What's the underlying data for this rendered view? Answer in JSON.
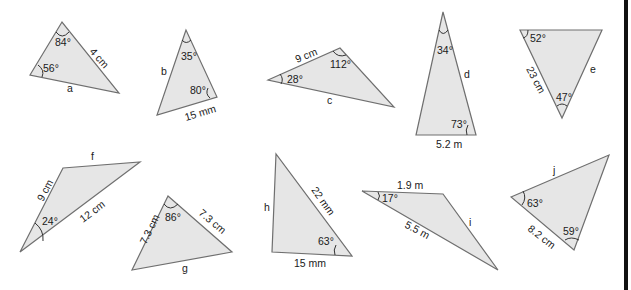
{
  "worksheet": {
    "triangles": [
      {
        "id": "a",
        "unknown": "a",
        "side": "4 cm",
        "angles": [
          "84°",
          "56°"
        ]
      },
      {
        "id": "b",
        "unknown": "b",
        "side": "15 mm",
        "angles": [
          "35°",
          "80°"
        ]
      },
      {
        "id": "c",
        "unknown": "c",
        "side": "9 cm",
        "angles": [
          "28°",
          "112°"
        ]
      },
      {
        "id": "d",
        "unknown": "d",
        "side": "5.2 m",
        "angles": [
          "34°",
          "73°"
        ]
      },
      {
        "id": "e",
        "unknown": "e",
        "side": "23 cm",
        "angles": [
          "52°",
          "47°"
        ]
      },
      {
        "id": "f",
        "unknown": "f",
        "sides": [
          "9 cm",
          "12 cm"
        ],
        "angles": [
          "24°"
        ]
      },
      {
        "id": "g",
        "unknown": "g",
        "sides": [
          "7.3 cm",
          "7.3 cm"
        ],
        "angles": [
          "86°"
        ]
      },
      {
        "id": "h",
        "unknown": "h",
        "sides": [
          "22 mm",
          "15 mm"
        ],
        "angles": [
          "63°"
        ]
      },
      {
        "id": "i",
        "unknown": "i",
        "sides": [
          "1.9 m",
          "5.5 m"
        ],
        "angles": [
          "17°"
        ]
      },
      {
        "id": "j",
        "unknown": "j",
        "side": "8.2 cm",
        "angles": [
          "63°",
          "59°"
        ]
      }
    ]
  },
  "colors": {
    "fill": "#e6e6e6",
    "stroke": "#6f6f6f",
    "border": "#111111"
  }
}
